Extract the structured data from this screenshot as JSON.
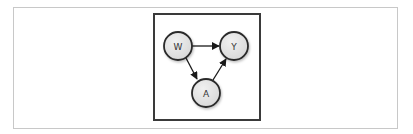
{
  "diagram": {
    "type": "directed-acyclic-graph",
    "nodes": [
      {
        "id": "W",
        "label": "W",
        "cx": 178,
        "cy": 46
      },
      {
        "id": "Y",
        "label": "Y",
        "cx": 234,
        "cy": 46
      },
      {
        "id": "A",
        "label": "A",
        "cx": 206,
        "cy": 93
      }
    ],
    "edges": [
      {
        "from": "W",
        "to": "Y"
      },
      {
        "from": "W",
        "to": "A"
      },
      {
        "from": "A",
        "to": "Y"
      }
    ],
    "colors": {
      "node_fill": "#e6e6e6",
      "node_stroke": "#2a2a2a",
      "edge": "#1a1a1a",
      "frame": "#3a3a3a",
      "outer_frame": "#c8c8c8"
    }
  }
}
